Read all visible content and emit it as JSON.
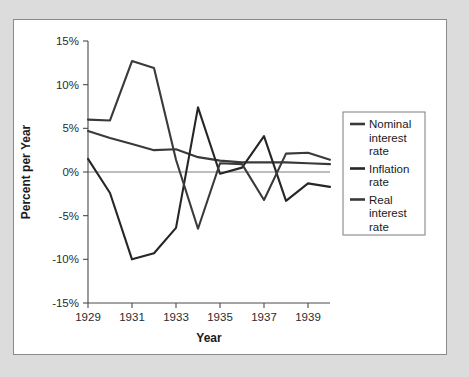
{
  "figure": {
    "background_color": "#dcdcdc",
    "panel_color": "#ffffff",
    "panel_border_color": "#8a8a8a"
  },
  "chart_data": {
    "type": "line",
    "title": "",
    "xlabel": "Year",
    "ylabel": "Percent per Year",
    "xlim": [
      1929,
      1940
    ],
    "ylim": [
      -15,
      15
    ],
    "ytick_labels": [
      "15%",
      "10%",
      "5%",
      "0%",
      "-5%",
      "-10%",
      "-15%"
    ],
    "ytick_values": [
      15,
      10,
      5,
      0,
      -5,
      -10,
      -15
    ],
    "xtick_labels": [
      "1929",
      "1931",
      "1933",
      "1935",
      "1937",
      "1939"
    ],
    "xtick_values": [
      1929,
      1931,
      1933,
      1935,
      1937,
      1939
    ],
    "grid": false,
    "zero_line": true,
    "legend_position": "right",
    "x": [
      1929,
      1930,
      1931,
      1932,
      1933,
      1934,
      1935,
      1936,
      1937,
      1938,
      1939,
      1940
    ],
    "series": [
      {
        "name": "Nominal interest rate",
        "color": "#3a3a3a",
        "values": [
          4.7,
          3.9,
          3.2,
          2.5,
          2.6,
          1.7,
          1.3,
          1.1,
          1.1,
          1.1,
          1.0,
          0.9
        ]
      },
      {
        "name": "Inflation rate",
        "color": "#262626",
        "values": [
          1.5,
          -2.4,
          -10.0,
          -9.3,
          -6.4,
          7.4,
          -0.2,
          0.5,
          4.1,
          -3.3,
          -1.3,
          -1.7
        ]
      },
      {
        "name": "Real interest rate",
        "color": "#3a3a3a",
        "values": [
          6.0,
          5.9,
          12.7,
          11.9,
          1.4,
          -6.5,
          1.0,
          0.9,
          -3.2,
          2.1,
          2.2,
          1.4
        ]
      }
    ]
  },
  "legend": {
    "entries": [
      {
        "label_lines": [
          "Nominal",
          "interest",
          "rate"
        ],
        "color": "#3a3a3a"
      },
      {
        "label_lines": [
          "Inflation",
          "rate"
        ],
        "color": "#262626"
      },
      {
        "label_lines": [
          "Real",
          "interest",
          "rate"
        ],
        "color": "#3a3a3a"
      }
    ]
  }
}
